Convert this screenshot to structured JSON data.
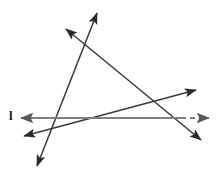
{
  "figure": {
    "width": 223,
    "height": 175,
    "background_color": "#ffffff",
    "labels": [
      {
        "name": "line-l-label",
        "text": "l",
        "x": 9,
        "y": 109,
        "color": "#1a1a1a"
      }
    ],
    "lines": [
      {
        "name": "horizontal-line-l",
        "description": "gray horizontal line labeled l, solid on the left, dashed on the right past the intersection",
        "color": "#808080",
        "stroke_width": 2.2,
        "solid_segment": {
          "x1": 21,
          "y1": 118,
          "x2": 180,
          "y2": 118
        },
        "dashed_segment": {
          "x1": 180,
          "y1": 118,
          "x2": 209,
          "y2": 118
        },
        "dash_pattern": "5,4",
        "arrow_start": "left",
        "arrow_end": "right"
      },
      {
        "name": "steep-line",
        "description": "steep line rising from lower-left to upper-right",
        "color": "#3a3a3a",
        "stroke_width": 1.5,
        "segment": {
          "x1": 37,
          "y1": 166,
          "x2": 97,
          "y2": 13
        },
        "arrow_start": "down-left",
        "arrow_end": "up-right"
      },
      {
        "name": "descending-line",
        "description": "line descending from upper-left to lower-right",
        "color": "#3a3a3a",
        "stroke_width": 1.5,
        "segment": {
          "x1": 66,
          "y1": 29,
          "x2": 201,
          "y2": 140
        },
        "arrow_start": "up-left",
        "arrow_end": "down-right"
      },
      {
        "name": "shallow-rising-line",
        "description": "shallow line rising from left to upper-right",
        "color": "#3a3a3a",
        "stroke_width": 1.5,
        "segment": {
          "x1": 24,
          "y1": 136,
          "x2": 196,
          "y2": 90
        },
        "arrow_start": "left",
        "arrow_end": "up-right"
      }
    ],
    "intersections": [
      {
        "name": "steep-descending-crossing",
        "x": 85,
        "y": 40
      },
      {
        "name": "steep-shallow-crossing",
        "x": 52,
        "y": 129
      },
      {
        "name": "steep-horizontal-crossing",
        "x": 56,
        "y": 118
      },
      {
        "name": "descending-shallow-crossing",
        "x": 163,
        "y": 100
      },
      {
        "name": "descending-horizontal-crossing",
        "x": 180,
        "y": 118
      },
      {
        "name": "shallow-horizontal-crossing",
        "x": 68,
        "y": 125
      }
    ]
  }
}
